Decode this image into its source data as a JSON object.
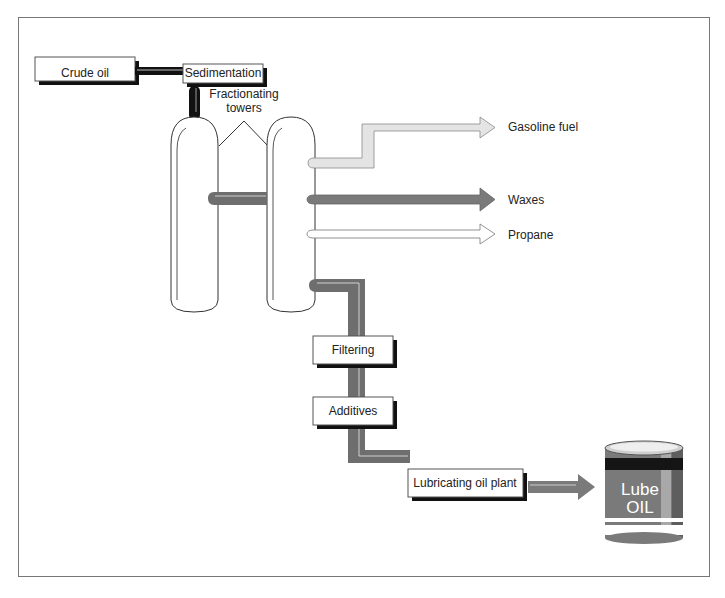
{
  "diagram": {
    "boxes": {
      "crude_oil": "Crude oil",
      "sedimentation": "Sedimentation",
      "filtering": "Filtering",
      "additives": "Additives",
      "lubricating_plant": "Lubricating oil plant"
    },
    "callout": {
      "line1": "Fractionating",
      "line2": "towers"
    },
    "outputs": [
      {
        "label": "Gasoline fuel",
        "color": "#e4e4e4"
      },
      {
        "label": "Waxes",
        "color": "#7a7a7a"
      },
      {
        "label": "Propane",
        "color": "#ffffff"
      }
    ],
    "product": {
      "line1": "Lube",
      "line2": "OIL"
    },
    "colors": {
      "pipe_dark": "#6e6e6e",
      "pipe_black": "#111111",
      "frame": "#777777"
    }
  }
}
